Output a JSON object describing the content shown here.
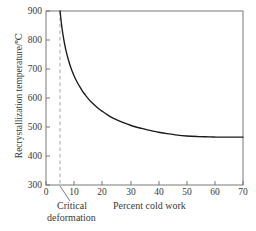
{
  "chart_data": {
    "type": "line",
    "title": "",
    "xlabel": "Percent cold work",
    "ylabel": "Recrystallization temperature/℃",
    "xlim": [
      0,
      70
    ],
    "ylim": [
      300,
      900
    ],
    "grid": false,
    "legend": "none",
    "xticks": [
      "0",
      "10",
      "20",
      "30",
      "40",
      "50",
      "60",
      "70"
    ],
    "xtick_values": [
      0,
      10,
      20,
      30,
      40,
      50,
      60,
      70
    ],
    "yticks": [
      "300",
      "400",
      "500",
      "600",
      "700",
      "800",
      "900"
    ],
    "ytick_values": [
      300,
      400,
      500,
      600,
      700,
      800,
      900
    ],
    "series": [
      {
        "name": "Recrystallization temperature",
        "style": "solid",
        "color": "#1a1a1a",
        "x": [
          5,
          5.5,
          6,
          6.5,
          7,
          8,
          9,
          10,
          11,
          12,
          13,
          14,
          15,
          16,
          17,
          18,
          19,
          20,
          22,
          24,
          26,
          28,
          30,
          32,
          34,
          36,
          38,
          40,
          43,
          46,
          50,
          54,
          58,
          62,
          66,
          70
        ],
        "y": [
          900,
          855,
          820,
          792,
          768,
          730,
          700,
          676,
          656,
          639,
          623,
          610,
          598,
          587,
          578,
          569,
          561,
          554,
          541,
          530,
          521,
          513,
          506,
          500,
          495,
          490,
          486,
          482,
          477,
          473,
          469,
          467,
          466,
          465,
          465,
          465
        ]
      }
    ],
    "annotations": [
      {
        "name": "critical-deformation",
        "text": "Critical deformation",
        "line1": "Critical",
        "line2": "deformation",
        "x": 5,
        "marker": "dashed-vertical-line",
        "color": "#9a9a9a"
      },
      {
        "name": "percent-cold-work-label",
        "text": "Percent cold work"
      }
    ]
  },
  "axes": {
    "y_title": "Recrystallization temperature/℃",
    "x_title": "Percent cold work",
    "critical_line1": "Critical",
    "critical_line2": "deformation"
  },
  "colors": {
    "curve": "#1a1a1a",
    "frame": "#6b6b6b",
    "dashed_guide": "#a5a5a5",
    "text": "#3a3a3a",
    "background": "#ffffff"
  }
}
